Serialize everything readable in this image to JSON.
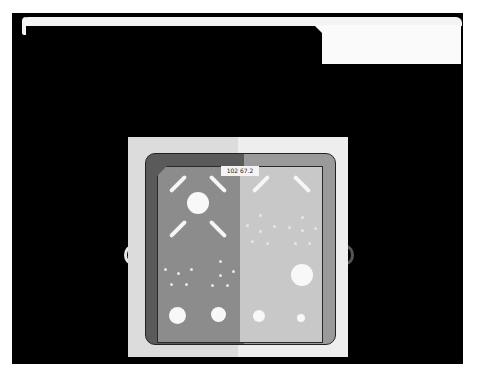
{
  "image": {
    "type": "x-ray-phantom",
    "label_text": "102 67.2",
    "colors": {
      "background": "#000000",
      "phantom_outer_left": "#dcdcdc",
      "phantom_outer_right": "#eeeeee",
      "plate_left": "#5a5a5a",
      "plate_right": "#9a9a9a",
      "field_left": "#8c8c8c",
      "field_right": "#c8c8c8",
      "features": "#f8f8f8"
    },
    "features": {
      "large_disks_bottom": 4,
      "large_disk_center_left": 1,
      "large_disk_right": 1,
      "bars": 6
    }
  }
}
